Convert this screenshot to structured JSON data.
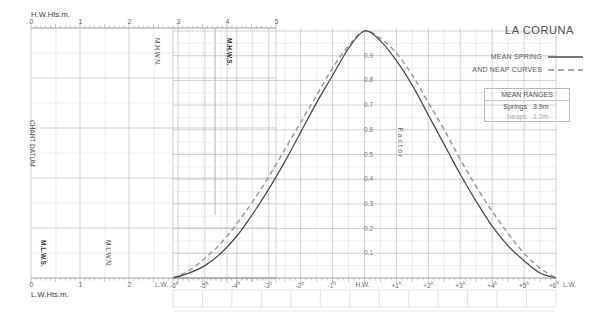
{
  "title": "LA CORUNA",
  "legend": {
    "line1": "MEAN SPRING",
    "line2": "AND NEAP CURVES",
    "spring_style": "solid",
    "neap_style": "dashed"
  },
  "ranges_box": {
    "header": "MEAN RANGES",
    "rows": [
      {
        "label": "Springs",
        "value": "3.9m"
      },
      {
        "label": "Neaps",
        "value": "1.2m"
      }
    ]
  },
  "axes": {
    "top": {
      "name": "H.W.Hts.m.",
      "ticks": [
        "0",
        "1",
        "2",
        "3",
        "4",
        "5"
      ]
    },
    "bottom_left": {
      "name": "L.W.Hts.m.",
      "ticks": [
        "0",
        "1",
        "2"
      ]
    },
    "factor": {
      "name": "Factor",
      "ticks": [
        "0.9",
        "0.8",
        "0.7",
        "0.6",
        "0.5",
        "0.4",
        "0.3",
        "0.2",
        "0.1"
      ]
    },
    "time": {
      "labels": [
        "L.W.",
        "-6",
        "-5",
        "-4",
        "-3",
        "-2",
        "-1",
        "H.W.",
        "+1",
        "+2",
        "+3",
        "+4",
        "+5",
        "+6",
        "L.W."
      ],
      "hour_mark": "h"
    }
  },
  "datum_labels": {
    "chart_datum": "CHART DATUM",
    "mhwn": "M.H.W.N.",
    "mhws": "M.H.W.S.",
    "mlwn": "M.L.W.N.",
    "mlws": "M.L.W.S."
  },
  "colors": {
    "spring_curve": "#4a4a4a",
    "neap_curve": "#9a9a9a",
    "grid_major": "#b0b0b0",
    "grid_minor": "#dcdcdc",
    "axis": "#8c8c8c",
    "text": "#555555"
  },
  "chart_data": {
    "type": "line",
    "title": "LA CORUNA",
    "xlabel": "Hours from High Water",
    "ylabel": "Factor",
    "ylim": [
      0,
      1
    ],
    "xlim": [
      -6,
      6
    ],
    "grid": true,
    "legend_position": "top-right",
    "x": [
      -6,
      -5.5,
      -5,
      -4.5,
      -4,
      -3.5,
      -3,
      -2.5,
      -2,
      -1.5,
      -1,
      -0.5,
      0,
      0.5,
      1,
      1.5,
      2,
      2.5,
      3,
      3.5,
      4,
      4.5,
      5,
      5.5,
      6
    ],
    "series": [
      {
        "name": "MEAN SPRING",
        "style": "solid",
        "values": [
          0.0,
          0.02,
          0.05,
          0.1,
          0.17,
          0.26,
          0.36,
          0.47,
          0.59,
          0.71,
          0.82,
          0.93,
          1.0,
          0.96,
          0.88,
          0.78,
          0.66,
          0.54,
          0.42,
          0.31,
          0.21,
          0.13,
          0.07,
          0.02,
          0.0
        ]
      },
      {
        "name": "MEAN NEAP",
        "style": "dashed",
        "values": [
          0.0,
          0.03,
          0.08,
          0.14,
          0.22,
          0.31,
          0.41,
          0.52,
          0.63,
          0.74,
          0.85,
          0.94,
          1.0,
          0.97,
          0.91,
          0.82,
          0.71,
          0.6,
          0.48,
          0.37,
          0.27,
          0.18,
          0.1,
          0.04,
          0.0
        ]
      }
    ],
    "annotations": [
      {
        "text": "MEAN RANGES Springs 3.9m",
        "value": 3.9
      },
      {
        "text": "MEAN RANGES Neaps 1.2m",
        "value": 1.2
      }
    ]
  },
  "bottom_table": {
    "columns": 13,
    "cells": [
      "",
      "",
      "",
      "",
      "",
      "",
      "",
      "",
      "",
      "",
      "",
      "",
      ""
    ]
  }
}
